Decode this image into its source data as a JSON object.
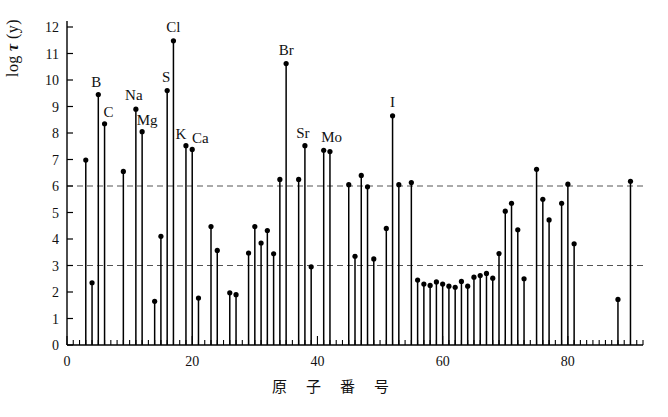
{
  "figure": {
    "xlabel": "原 子 番 号",
    "ylabel_prefix": "log ",
    "ylabel_tau": "τ",
    "ylabel_suffix": " (y)",
    "caption": ""
  },
  "colors": {
    "axis": "#000000",
    "stem": "#000000",
    "marker": "#000000",
    "gridline": "#555555",
    "background": "#ffffff"
  },
  "chart_data": {
    "type": "bar",
    "title": "",
    "subtitle": "",
    "xlabel": "原 子 番 号",
    "ylabel": "log τ (y)",
    "xlim": [
      0,
      92
    ],
    "ylim": [
      0,
      12.4
    ],
    "xticks": [
      0,
      20,
      40,
      60,
      80
    ],
    "xtick_labels": [
      "0",
      "20",
      "40",
      "60",
      "80"
    ],
    "yticks": [
      0,
      1,
      2,
      3,
      4,
      5,
      6,
      7,
      8,
      9,
      10,
      11,
      12
    ],
    "ytick_labels": [
      "0",
      "1",
      "2",
      "3",
      "4",
      "5",
      "6",
      "7",
      "8",
      "9",
      "10",
      "11",
      "12"
    ],
    "grid": true,
    "gridlines_y": [
      3,
      6
    ],
    "gridline_style": "dashed",
    "legend": "none",
    "marker": "filled-circle",
    "xminor_tick_step": 1,
    "x": [
      3,
      4,
      5,
      6,
      9,
      11,
      12,
      14,
      15,
      16,
      17,
      19,
      20,
      21,
      23,
      24,
      26,
      27,
      29,
      30,
      31,
      32,
      33,
      34,
      35,
      37,
      38,
      39,
      41,
      42,
      45,
      46,
      47,
      48,
      49,
      51,
      52,
      53,
      55,
      56,
      57,
      58,
      59,
      60,
      61,
      62,
      63,
      64,
      65,
      66,
      67,
      68,
      69,
      70,
      71,
      72,
      73,
      75,
      76,
      77,
      79,
      80,
      81,
      88,
      90
    ],
    "values": [
      6.98,
      2.35,
      9.45,
      8.35,
      6.55,
      8.9,
      8.05,
      1.65,
      4.1,
      9.6,
      11.48,
      7.52,
      7.38,
      1.77,
      4.47,
      3.57,
      1.97,
      1.9,
      3.47,
      4.47,
      3.85,
      4.32,
      3.44,
      6.25,
      10.62,
      6.25,
      7.52,
      2.95,
      7.35,
      7.3,
      6.05,
      3.35,
      6.4,
      5.97,
      3.25,
      4.4,
      8.65,
      6.05,
      6.13,
      2.45,
      2.3,
      2.25,
      2.38,
      2.3,
      2.22,
      2.18,
      2.4,
      2.22,
      2.56,
      2.62,
      2.7,
      2.52,
      3.45,
      5.05,
      5.35,
      4.35,
      2.5,
      6.63,
      5.5,
      4.72,
      5.35,
      6.07,
      3.82,
      1.72,
      6.18
    ],
    "series": [
      {
        "name": "log τ (y)",
        "points": [
          {
            "z": 3,
            "value": 6.98,
            "label": ""
          },
          {
            "z": 4,
            "value": 2.35,
            "label": ""
          },
          {
            "z": 5,
            "value": 9.45,
            "label": "B"
          },
          {
            "z": 6,
            "value": 8.35,
            "label": "C"
          },
          {
            "z": 9,
            "value": 6.55,
            "label": ""
          },
          {
            "z": 11,
            "value": 8.9,
            "label": "Na"
          },
          {
            "z": 12,
            "value": 8.05,
            "label": "Mg"
          },
          {
            "z": 14,
            "value": 1.65,
            "label": ""
          },
          {
            "z": 15,
            "value": 4.1,
            "label": ""
          },
          {
            "z": 16,
            "value": 9.6,
            "label": "S"
          },
          {
            "z": 17,
            "value": 11.48,
            "label": "Cl"
          },
          {
            "z": 19,
            "value": 7.52,
            "label": "K"
          },
          {
            "z": 20,
            "value": 7.38,
            "label": "Ca"
          },
          {
            "z": 21,
            "value": 1.77,
            "label": ""
          },
          {
            "z": 23,
            "value": 4.47,
            "label": ""
          },
          {
            "z": 24,
            "value": 3.57,
            "label": ""
          },
          {
            "z": 26,
            "value": 1.97,
            "label": ""
          },
          {
            "z": 27,
            "value": 1.9,
            "label": ""
          },
          {
            "z": 29,
            "value": 3.47,
            "label": ""
          },
          {
            "z": 30,
            "value": 4.47,
            "label": ""
          },
          {
            "z": 31,
            "value": 3.85,
            "label": ""
          },
          {
            "z": 32,
            "value": 4.32,
            "label": ""
          },
          {
            "z": 33,
            "value": 3.44,
            "label": ""
          },
          {
            "z": 34,
            "value": 6.25,
            "label": ""
          },
          {
            "z": 35,
            "value": 10.62,
            "label": "Br"
          },
          {
            "z": 37,
            "value": 6.25,
            "label": ""
          },
          {
            "z": 38,
            "value": 7.52,
            "label": "Sr"
          },
          {
            "z": 39,
            "value": 2.95,
            "label": ""
          },
          {
            "z": 41,
            "value": 7.35,
            "label": "Mo"
          },
          {
            "z": 42,
            "value": 7.3,
            "label": ""
          },
          {
            "z": 45,
            "value": 6.05,
            "label": ""
          },
          {
            "z": 46,
            "value": 3.35,
            "label": ""
          },
          {
            "z": 47,
            "value": 6.4,
            "label": ""
          },
          {
            "z": 48,
            "value": 5.97,
            "label": ""
          },
          {
            "z": 49,
            "value": 3.25,
            "label": ""
          },
          {
            "z": 51,
            "value": 4.4,
            "label": ""
          },
          {
            "z": 52,
            "value": 8.65,
            "label": "I"
          },
          {
            "z": 53,
            "value": 6.05,
            "label": ""
          },
          {
            "z": 55,
            "value": 6.13,
            "label": ""
          },
          {
            "z": 56,
            "value": 2.45,
            "label": ""
          },
          {
            "z": 57,
            "value": 2.3,
            "label": ""
          },
          {
            "z": 58,
            "value": 2.25,
            "label": ""
          },
          {
            "z": 59,
            "value": 2.38,
            "label": ""
          },
          {
            "z": 60,
            "value": 2.3,
            "label": ""
          },
          {
            "z": 61,
            "value": 2.22,
            "label": ""
          },
          {
            "z": 62,
            "value": 2.18,
            "label": ""
          },
          {
            "z": 63,
            "value": 2.4,
            "label": ""
          },
          {
            "z": 64,
            "value": 2.22,
            "label": ""
          },
          {
            "z": 65,
            "value": 2.56,
            "label": ""
          },
          {
            "z": 66,
            "value": 2.62,
            "label": ""
          },
          {
            "z": 67,
            "value": 2.7,
            "label": ""
          },
          {
            "z": 68,
            "value": 2.52,
            "label": ""
          },
          {
            "z": 69,
            "value": 3.45,
            "label": ""
          },
          {
            "z": 70,
            "value": 5.05,
            "label": ""
          },
          {
            "z": 71,
            "value": 5.35,
            "label": ""
          },
          {
            "z": 72,
            "value": 4.35,
            "label": ""
          },
          {
            "z": 73,
            "value": 2.5,
            "label": ""
          },
          {
            "z": 75,
            "value": 6.63,
            "label": ""
          },
          {
            "z": 76,
            "value": 5.5,
            "label": ""
          },
          {
            "z": 77,
            "value": 4.72,
            "label": ""
          },
          {
            "z": 79,
            "value": 5.35,
            "label": ""
          },
          {
            "z": 80,
            "value": 6.07,
            "label": ""
          },
          {
            "z": 81,
            "value": 3.82,
            "label": ""
          },
          {
            "z": 88,
            "value": 1.72,
            "label": ""
          },
          {
            "z": 90,
            "value": 6.18,
            "label": ""
          }
        ]
      }
    ],
    "annotations": [
      {
        "text": "B",
        "z": 5,
        "value": 9.45
      },
      {
        "text": "C",
        "z": 6,
        "value": 8.35
      },
      {
        "text": "Na",
        "z": 11,
        "value": 8.9
      },
      {
        "text": "Mg",
        "z": 12,
        "value": 8.05
      },
      {
        "text": "S",
        "z": 16,
        "value": 9.6
      },
      {
        "text": "Cl",
        "z": 17,
        "value": 11.48
      },
      {
        "text": "K",
        "z": 19,
        "value": 7.52
      },
      {
        "text": "Ca",
        "z": 20,
        "value": 7.38
      },
      {
        "text": "Br",
        "z": 35,
        "value": 10.62
      },
      {
        "text": "Sr",
        "z": 38,
        "value": 7.52
      },
      {
        "text": "Mo",
        "z": 41,
        "value": 7.35
      },
      {
        "text": "I",
        "z": 52,
        "value": 8.65
      }
    ]
  }
}
